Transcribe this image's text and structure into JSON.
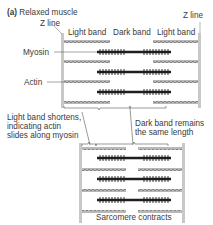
{
  "panel": {
    "letter": "(a)",
    "title": "Relaxed muscle"
  },
  "labels": {
    "z_line_left": "Z line",
    "z_line_right": "Z line",
    "light_band_left": "Light band",
    "dark_band": "Dark band",
    "light_band_right": "Light band",
    "myosin": "Myosin",
    "actin": "Actin",
    "light_band_note_1": "Light band shortens,",
    "light_band_note_2": "indicating actin",
    "light_band_note_3": "slides along myosin",
    "dark_band_note_1": "Dark band remains",
    "dark_band_note_2": "the same length",
    "bottom_caption": "Sarcomere contracts"
  },
  "colors": {
    "z_line": "#c8c8c8",
    "actin": "#9a9a9a",
    "myosin": "#1e1e1e",
    "text": "#3a3a3a"
  }
}
